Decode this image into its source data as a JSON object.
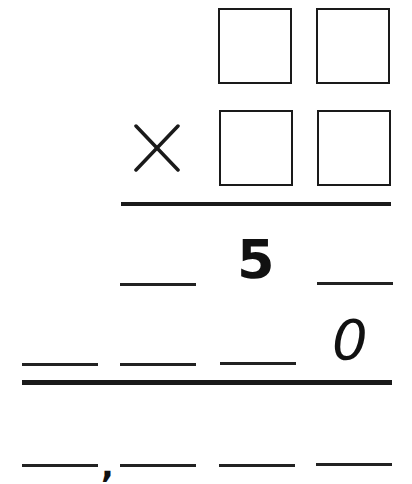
{
  "worksheet": {
    "operator": "×",
    "multiplicand_boxes": [
      "",
      ""
    ],
    "multiplier_boxes": [
      "",
      ""
    ],
    "partial_product_1": {
      "digits": [
        "",
        "5",
        ""
      ]
    },
    "partial_product_2": {
      "digits": [
        "",
        "",
        "",
        "0"
      ]
    },
    "final_product": {
      "digits": [
        "",
        "",
        "",
        ""
      ],
      "separator": ","
    },
    "colors": {
      "ink": "#1a1a1a",
      "background": "#ffffff"
    }
  }
}
